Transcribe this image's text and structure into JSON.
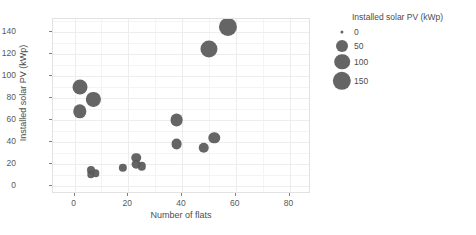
{
  "chart_data": {
    "type": "scatter",
    "title": "",
    "xlabel": "Number of flats",
    "ylabel": "Installed solar PV (kWp)",
    "xlim": [
      -8,
      88
    ],
    "ylim": [
      -7,
      152
    ],
    "xticks": [
      0,
      20,
      40,
      60,
      80
    ],
    "yticks": [
      0,
      20,
      40,
      60,
      80,
      100,
      120,
      140
    ],
    "grid": true,
    "legend": {
      "title": "Installed solar PV (kWp)",
      "position": "right",
      "entries": [
        {
          "label": "0",
          "size": 0
        },
        {
          "label": "50",
          "size": 50
        },
        {
          "label": "100",
          "size": 100
        },
        {
          "label": "150",
          "size": 150
        }
      ]
    },
    "size_encoding": "Installed solar PV (kWp)",
    "marker_color": "#595959",
    "points": [
      {
        "x": 2,
        "y": 90,
        "size": 90
      },
      {
        "x": 7,
        "y": 79,
        "size": 79
      },
      {
        "x": 2,
        "y": 68,
        "size": 68
      },
      {
        "x": 6,
        "y": 15,
        "size": 15
      },
      {
        "x": 6,
        "y": 11,
        "size": 11
      },
      {
        "x": 8,
        "y": 12,
        "size": 12
      },
      {
        "x": 18,
        "y": 17,
        "size": 17
      },
      {
        "x": 23,
        "y": 26,
        "size": 26
      },
      {
        "x": 23,
        "y": 20,
        "size": 20
      },
      {
        "x": 25,
        "y": 18,
        "size": 18
      },
      {
        "x": 38,
        "y": 60,
        "size": 60
      },
      {
        "x": 38,
        "y": 38,
        "size": 38
      },
      {
        "x": 48,
        "y": 35,
        "size": 35
      },
      {
        "x": 52,
        "y": 44,
        "size": 44
      },
      {
        "x": 50,
        "y": 125,
        "size": 125
      },
      {
        "x": 57,
        "y": 145,
        "size": 145
      }
    ]
  }
}
